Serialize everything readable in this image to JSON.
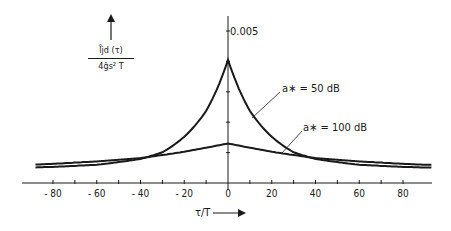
{
  "chart_data": {
    "type": "line",
    "title": "",
    "xlabel": "τ/T",
    "ylabel": "l̊jd (τ) / 4ĝs² T",
    "y_axis_max_label": "0.005",
    "xlim": [
      -92,
      92
    ],
    "ylim": [
      0,
      0.005
    ],
    "x_ticks": [
      -80,
      -60,
      -40,
      -20,
      0,
      20,
      40,
      60,
      80
    ],
    "x_minor_ticks": [
      -70,
      -50,
      -30,
      -10,
      10,
      30,
      50,
      70
    ],
    "y_ticks": [
      0.001,
      0.002,
      0.003,
      0.004,
      0.005
    ],
    "grid": false,
    "legend": "inline annotations",
    "series": [
      {
        "name": "a* = 50 dB",
        "x": [
          -90,
          -80,
          -60,
          -40,
          -30,
          -20,
          -10,
          0,
          10,
          20,
          30,
          40,
          60,
          80,
          90
        ],
        "values": [
          0.00051,
          0.00053,
          0.0006,
          0.00079,
          0.00101,
          0.00152,
          0.00237,
          0.00405,
          0.00237,
          0.00152,
          0.00101,
          0.00079,
          0.0006,
          0.00053,
          0.00051
        ]
      },
      {
        "name": "a* = 100 dB",
        "x": [
          -90,
          -80,
          -60,
          -40,
          -30,
          -20,
          -10,
          0,
          10,
          20,
          30,
          40,
          60,
          80,
          90
        ],
        "values": [
          0.0006,
          0.00063,
          0.00071,
          0.00082,
          0.00092,
          0.00103,
          0.00116,
          0.0013,
          0.00116,
          0.00103,
          0.00092,
          0.00082,
          0.00071,
          0.00063,
          0.0006
        ]
      }
    ],
    "annotations": [
      {
        "text_prefix": "a",
        "subscript": "*",
        "text_suffix": " = 50 dB",
        "series": "a* = 50 dB"
      },
      {
        "text_prefix": "a",
        "subscript": "*",
        "text_suffix": " = 100 dB",
        "series": "a* = 100 dB"
      }
    ]
  },
  "labels": {
    "ylabel_num": "l̊jd (τ)",
    "ylabel_den": "4ĝs² T",
    "xlabel": "τ/T",
    "ymax": "0.005",
    "annot_50": "a∗ = 50 dB",
    "annot_100": "a∗ = 100 dB",
    "ticks": [
      "- 80",
      "- 60",
      "- 40",
      "- 20",
      "0",
      "20",
      "40",
      "60",
      "80"
    ]
  }
}
